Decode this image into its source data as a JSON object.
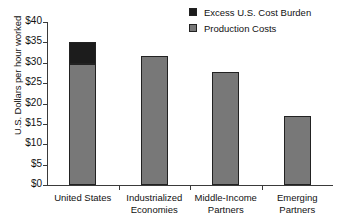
{
  "chart_data": {
    "type": "bar",
    "title": "",
    "xlabel": "",
    "ylabel": "U.S. Dollars per hour worked",
    "ylim": [
      0,
      40
    ],
    "ytick_values": [
      40,
      35,
      30,
      25,
      20,
      15,
      10,
      5,
      0
    ],
    "ytick_labels": [
      "$40",
      "$35",
      "$30",
      "$25",
      "$20",
      "$15",
      "$10",
      "$5",
      "$0"
    ],
    "grid": false,
    "legend_position": "top-right",
    "stacked": true,
    "categories": [
      "United States",
      "Industrialized Economies",
      "Middle-Income Partners",
      "Emerging Partners"
    ],
    "category_lines": [
      [
        "United States"
      ],
      [
        "Industrialized",
        "Economies"
      ],
      [
        "Middle-Income",
        "Partners"
      ],
      [
        "Emerging",
        "Partners"
      ]
    ],
    "series": [
      {
        "name": "Production Costs",
        "color": "#787878",
        "values": [
          29.7,
          31.7,
          27.8,
          17.0
        ]
      },
      {
        "name": "Excess U.S. Cost Burden",
        "color": "#1c1c1c",
        "values": [
          5.3,
          0,
          0,
          0
        ]
      }
    ],
    "totals": [
      35.0,
      31.7,
      27.8,
      17.0
    ]
  },
  "legend": {
    "items": [
      {
        "label": "Excess U.S. Cost Burden",
        "color": "#1c1c1c"
      },
      {
        "label": "Production Costs",
        "color": "#787878"
      }
    ]
  }
}
